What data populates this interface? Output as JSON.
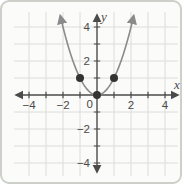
{
  "chart_data": {
    "type": "line",
    "title": "",
    "function": "y = x²",
    "curve": {
      "coefficient": 1,
      "x_extent_drawn": [
        -2.16,
        2.16
      ]
    },
    "marked_points": [
      [
        -1,
        1
      ],
      [
        0,
        0
      ],
      [
        1,
        1
      ]
    ],
    "xlabel": "x",
    "ylabel": "y",
    "origin_label": "0",
    "x_axis": {
      "range_shown": [
        -4.8,
        4.8
      ],
      "tick_step": 1,
      "labeled_ticks": [
        {
          "v": -4,
          "t": "−4"
        },
        {
          "v": -2,
          "t": "−2"
        },
        {
          "v": 2,
          "t": "2"
        },
        {
          "v": 4,
          "t": "4"
        }
      ]
    },
    "y_axis": {
      "range_shown": [
        -4.7,
        4.7
      ],
      "tick_step": 1,
      "labeled_ticks": [
        {
          "v": 4,
          "t": "4"
        },
        {
          "v": 2,
          "t": "2"
        },
        {
          "v": -2,
          "t": "−2"
        },
        {
          "v": -4,
          "t": "−4"
        }
      ]
    },
    "grid": true,
    "legend": false,
    "colors": {
      "grid": "#dcdeda",
      "axis": "#4b4b4b",
      "curve": "#8b8b8b",
      "point": "#343434",
      "label": "#4a4a4a",
      "frame": "#ccd0c9",
      "background": "#fbfbf9"
    }
  }
}
